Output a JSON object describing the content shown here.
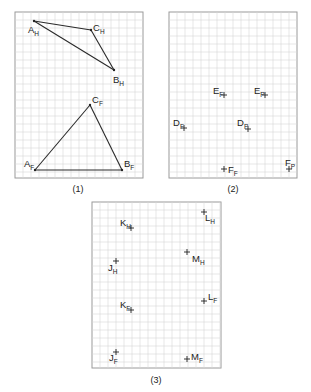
{
  "grid": {
    "spacing": 8,
    "line_color": "#d6d6d6",
    "frame_color": "#9a9a9a"
  },
  "panels": [
    {
      "id": "panel-1",
      "caption": "(1)",
      "caption_pos": [
        78,
        192
      ],
      "frame": {
        "x": 15,
        "y": 12,
        "w": 128,
        "h": 166
      },
      "points": [
        {
          "name": "A",
          "sub": "H",
          "x": 34,
          "y": 21,
          "lx": 28,
          "ly": 33,
          "mark": "dot"
        },
        {
          "name": "C",
          "sub": "H",
          "x": 91,
          "y": 30,
          "lx": 93,
          "ly": 31,
          "mark": "dot"
        },
        {
          "name": "B",
          "sub": "H",
          "x": 114,
          "y": 70,
          "lx": 113,
          "ly": 83,
          "mark": "dot"
        },
        {
          "name": "C",
          "sub": "F",
          "x": 90,
          "y": 105,
          "lx": 92,
          "ly": 103,
          "mark": "dot"
        },
        {
          "name": "A",
          "sub": "F",
          "x": 35,
          "y": 170,
          "lx": 24,
          "ly": 167,
          "mark": "dot"
        },
        {
          "name": "B",
          "sub": "F",
          "x": 122,
          "y": 170,
          "lx": 124,
          "ly": 167,
          "mark": "dot"
        }
      ],
      "segments": [
        [
          0,
          1
        ],
        [
          1,
          2
        ],
        [
          0,
          2
        ],
        [
          3,
          4
        ],
        [
          3,
          5
        ],
        [
          4,
          5
        ]
      ]
    },
    {
      "id": "panel-2",
      "caption": "(2)",
      "caption_pos": [
        233,
        192
      ],
      "frame": {
        "x": 169,
        "y": 12,
        "w": 128,
        "h": 166
      },
      "points": [
        {
          "name": "E",
          "sub": "F",
          "x": 224,
          "y": 95,
          "lx": 213,
          "ly": 94,
          "mark": "plus"
        },
        {
          "name": "E",
          "sub": "P",
          "x": 265,
          "y": 95,
          "lx": 254,
          "ly": 94,
          "mark": "plus"
        },
        {
          "name": "D",
          "sub": "F",
          "x": 184,
          "y": 128,
          "lx": 173,
          "ly": 126,
          "mark": "plus"
        },
        {
          "name": "D",
          "sub": "P",
          "x": 248,
          "y": 129,
          "lx": 237,
          "ly": 126,
          "mark": "plus"
        },
        {
          "name": "F",
          "sub": "F",
          "x": 224,
          "y": 169,
          "lx": 228,
          "ly": 173,
          "mark": "plus"
        },
        {
          "name": "F",
          "sub": "P",
          "x": 289,
          "y": 169,
          "lx": 285,
          "ly": 166,
          "mark": "plus"
        }
      ],
      "segments": []
    },
    {
      "id": "panel-3",
      "caption": "(3)",
      "caption_pos": [
        156,
        383
      ],
      "frame": {
        "x": 92,
        "y": 202,
        "w": 129,
        "h": 166
      },
      "points": [
        {
          "name": "K",
          "sub": "H",
          "x": 131,
          "y": 228,
          "lx": 120,
          "ly": 226,
          "mark": "plus"
        },
        {
          "name": "L",
          "sub": "H",
          "x": 204,
          "y": 212,
          "lx": 205,
          "ly": 221,
          "mark": "plus"
        },
        {
          "name": "M",
          "sub": "H",
          "x": 187,
          "y": 252,
          "lx": 192,
          "ly": 262,
          "mark": "plus"
        },
        {
          "name": "J",
          "sub": "H",
          "x": 116,
          "y": 261,
          "lx": 108,
          "ly": 271,
          "mark": "plus"
        },
        {
          "name": "K",
          "sub": "F",
          "x": 131,
          "y": 310,
          "lx": 120,
          "ly": 308,
          "mark": "plus"
        },
        {
          "name": "L",
          "sub": "F",
          "x": 204,
          "y": 301,
          "lx": 208,
          "ly": 300,
          "mark": "plus"
        },
        {
          "name": "J",
          "sub": "F",
          "x": 116,
          "y": 352,
          "lx": 109,
          "ly": 361,
          "mark": "plus"
        },
        {
          "name": "M",
          "sub": "F",
          "x": 187,
          "y": 359,
          "lx": 191,
          "ly": 360,
          "mark": "plus"
        }
      ],
      "segments": []
    }
  ]
}
